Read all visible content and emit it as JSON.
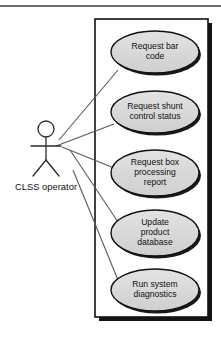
{
  "diagram": {
    "type": "uml-use-case-diagram",
    "colors": {
      "page_background": "#ffffff",
      "ellipse_fill": "#d9d9d9",
      "ellipse_stroke": "#111111",
      "boundary_stroke": "#111111",
      "boundary_shadow": "#141414",
      "line_stroke": "#5a5a5a",
      "actor_stroke": "#2b2b2b",
      "rule_color": "#3d3d3d",
      "text": "#111111"
    },
    "top_rule": {
      "name": "top-horizontal-rule",
      "x1": 0,
      "y1": 6,
      "x2": 221,
      "y2": 6
    },
    "system_boundary": {
      "name": "system-boundary-box",
      "x": 95,
      "y": 19,
      "width": 113,
      "height": 298
    },
    "actor": {
      "name": "CLSS operator",
      "label": "CLSS operator",
      "head_cx": 46,
      "head_cy": 129,
      "head_r": 8,
      "body_top_y": 137,
      "body_bottom_y": 160,
      "arms_y": 146,
      "arm_left_x": 31,
      "arm_right_x": 61,
      "leg_left_x": 33,
      "leg_right_x": 59,
      "leg_bottom_y": 176,
      "label_x": 46,
      "label_y": 190
    },
    "use_cases": [
      {
        "id": "request-bar-code",
        "label": "Request bar code",
        "lines": [
          "Request bar",
          "code"
        ],
        "cx": 155,
        "cy": 52,
        "rx": 44,
        "ry": 21
      },
      {
        "id": "request-shunt-control-status",
        "label": "Request shunt control status",
        "lines": [
          "Request shunt",
          "control status"
        ],
        "cx": 155,
        "cy": 112,
        "rx": 44,
        "ry": 21
      },
      {
        "id": "request-box-processing-report",
        "label": "Request box processing report",
        "lines": [
          "Request box",
          "processing",
          "report"
        ],
        "cx": 155,
        "cy": 173,
        "rx": 44,
        "ry": 23
      },
      {
        "id": "update-product-database",
        "label": "Update product database",
        "lines": [
          "Update",
          "product",
          "database"
        ],
        "cx": 155,
        "cy": 233,
        "rx": 44,
        "ry": 23
      },
      {
        "id": "run-system-diagnostics",
        "label": "Run system diagnostics",
        "lines": [
          "Run system",
          "diagnostics"
        ],
        "cx": 155,
        "cy": 290,
        "rx": 44,
        "ry": 21
      }
    ],
    "associations": [
      {
        "id": "assoc-bar-code",
        "from": "CLSS operator",
        "to": "Request bar code",
        "x1": 59,
        "y1": 140,
        "x2": 118,
        "y2": 70
      },
      {
        "id": "assoc-shunt-control-status",
        "from": "CLSS operator",
        "to": "Request shunt control status",
        "x1": 56,
        "y1": 146,
        "x2": 114,
        "y2": 124
      },
      {
        "id": "assoc-box-processing-report",
        "from": "CLSS operator",
        "to": "Request box processing report",
        "x1": 62,
        "y1": 147,
        "x2": 119,
        "y2": 170
      },
      {
        "id": "assoc-update-product-database",
        "from": "CLSS operator",
        "to": "Update product database",
        "x1": 70,
        "y1": 150,
        "x2": 122,
        "y2": 228
      },
      {
        "id": "assoc-run-system-diagnostics",
        "from": "CLSS operator",
        "to": "Run system diagnostics",
        "x1": 73,
        "y1": 170,
        "x2": 120,
        "y2": 285
      }
    ]
  }
}
